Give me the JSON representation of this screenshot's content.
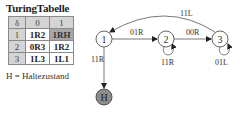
{
  "table": {
    "title": "TuringTabelle",
    "corner": "δ",
    "columns": [
      "0",
      "1"
    ],
    "rows": [
      {
        "state": "1",
        "cells": [
          "1R2",
          "1RH"
        ]
      },
      {
        "state": "2",
        "cells": [
          "0R3",
          "1R2"
        ]
      },
      {
        "state": "3",
        "cells": [
          "1L3",
          "1L1"
        ]
      }
    ],
    "legend": "H = Haltezustand"
  },
  "diagram": {
    "nodes": [
      {
        "id": "1",
        "label": "1",
        "x": 104,
        "y": 39,
        "fill": "#ffffff"
      },
      {
        "id": "2",
        "label": "2",
        "x": 166,
        "y": 39,
        "fill": "#ffffff"
      },
      {
        "id": "3",
        "label": "3",
        "x": 220,
        "y": 39,
        "fill": "#ffffff"
      },
      {
        "id": "H",
        "label": "H",
        "x": 104,
        "y": 97,
        "fill": "#8c8c8c"
      }
    ],
    "edges": [
      {
        "from": "1",
        "to": "2",
        "label": "01R"
      },
      {
        "from": "2",
        "to": "3",
        "label": "00R"
      },
      {
        "from": "3",
        "to": "1",
        "label": "11L"
      },
      {
        "from": "2",
        "to": "2",
        "label": "11R"
      },
      {
        "from": "3",
        "to": "3",
        "label": "01L"
      },
      {
        "from": "1",
        "to": "H",
        "label": "11R"
      }
    ]
  }
}
